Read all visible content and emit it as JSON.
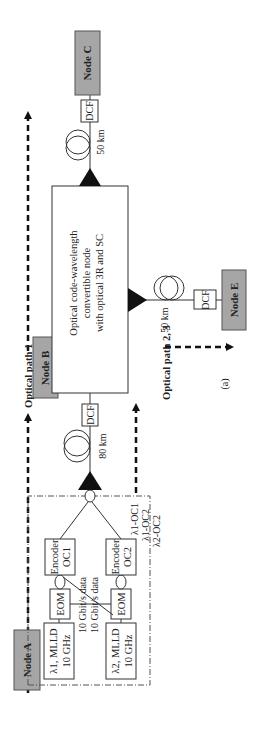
{
  "figure": {
    "caption": "(a)",
    "orientation": "rotated-90-ccw"
  },
  "colors": {
    "node_fill": "#a6a6a6",
    "node_stroke": "#555555",
    "line": "#333333",
    "amplifier": "#111111",
    "background": "#ffffff"
  },
  "nodes": {
    "a": {
      "label": "Node A"
    },
    "b": {
      "label": "Node B"
    },
    "c": {
      "label": "Node C"
    },
    "e": {
      "label": "Node E"
    }
  },
  "transmitter": {
    "laser1": {
      "line1": "λ1, MLLD",
      "line2": "10 GHz"
    },
    "laser2": {
      "line1": "λ2, MLLD",
      "line2": "10 GHz"
    },
    "eom1": {
      "label": "EOM"
    },
    "eom2": {
      "label": "EOM"
    },
    "data1": "10 Gbit/s data",
    "data2": "10 Gbit/s data",
    "encoder1": {
      "line1": "Encoder",
      "line2": "OC1"
    },
    "encoder2": {
      "line1": "Encoder",
      "line2": "OC2"
    },
    "legend": [
      "λ1-OC1",
      "λ1-OC2",
      "λ2-OC2"
    ]
  },
  "links": {
    "a_to_b": {
      "fiber": "80 km",
      "dcf": "DCF"
    },
    "b_to_c": {
      "fiber": "50 km",
      "dcf": "DCF"
    },
    "b_to_e": {
      "fiber": "50 km",
      "dcf": "DCF"
    }
  },
  "converter": {
    "line1": "Optical code-wavelength",
    "line2": "convertible node",
    "line3": "with optical 3R and SC"
  },
  "paths": {
    "path1": "Optical path 1",
    "path23": "Optical path 2, 3"
  }
}
